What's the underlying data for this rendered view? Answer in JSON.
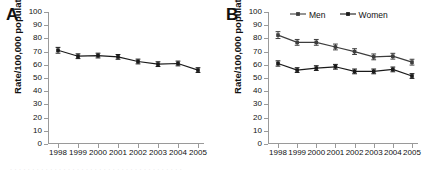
{
  "figure": {
    "cropped_caption_fragment": "· · · · · · · · · · · · · · · · · · · · · · · · · · · · · · · · · · · · · · ·"
  },
  "panels": [
    {
      "letter": "A",
      "ylabel": "Rate/100,000 population",
      "legend": []
    },
    {
      "letter": "B",
      "ylabel": "Rate/100,000 population",
      "legend": [
        "Men",
        "Women"
      ]
    }
  ],
  "chart_data": [
    {
      "type": "line",
      "title": "A",
      "xlabel": "",
      "ylabel": "Rate/100,000 population",
      "categories": [
        "1998",
        "1999",
        "2000",
        "2001",
        "2002",
        "2003",
        "2004",
        "2005"
      ],
      "x": [
        1998,
        1999,
        2000,
        2001,
        2002,
        2003,
        2004,
        2005
      ],
      "ylim": [
        0,
        100
      ],
      "yticks": [
        0,
        10,
        20,
        30,
        40,
        50,
        60,
        70,
        80,
        90,
        100
      ],
      "grid": false,
      "legend_position": "none",
      "series": [
        {
          "name": "Overall",
          "values": [
            71,
            66.5,
            67,
            66,
            62.5,
            60.5,
            61,
            56
          ],
          "error_upper": [
            2.2,
            1.8,
            1.8,
            1.8,
            1.8,
            1.8,
            1.8,
            1.8
          ],
          "error_lower": [
            2.2,
            1.8,
            1.8,
            1.8,
            1.8,
            1.8,
            1.8,
            1.8
          ],
          "color": "#1a1a1a",
          "marker": "square"
        }
      ]
    },
    {
      "type": "line",
      "title": "B",
      "xlabel": "",
      "ylabel": "Rate/100,000 population",
      "categories": [
        "1998",
        "1999",
        "2000",
        "2001",
        "2002",
        "2003",
        "2004",
        "2005"
      ],
      "x": [
        1998,
        1999,
        2000,
        2001,
        2002,
        2003,
        2004,
        2005
      ],
      "ylim": [
        0,
        100
      ],
      "yticks": [
        0,
        10,
        20,
        30,
        40,
        50,
        60,
        70,
        80,
        90,
        100
      ],
      "grid": false,
      "legend_position": "top-right",
      "series": [
        {
          "name": "Men",
          "values": [
            82.5,
            77,
            77,
            73.5,
            70,
            66,
            66.5,
            62
          ],
          "error_upper": [
            2.6,
            2.2,
            2.2,
            2.2,
            2.2,
            2.2,
            2.2,
            2.2
          ],
          "error_lower": [
            2.6,
            2.2,
            2.2,
            2.2,
            2.2,
            2.2,
            2.2,
            2.2
          ],
          "color": "#3d3d3d",
          "marker": "square"
        },
        {
          "name": "Women",
          "values": [
            61,
            56,
            57.5,
            58.5,
            55,
            55,
            56.5,
            51.5
          ],
          "error_upper": [
            2.0,
            1.8,
            1.8,
            1.8,
            1.8,
            1.8,
            1.8,
            1.8
          ],
          "error_lower": [
            2.0,
            1.8,
            1.8,
            1.8,
            1.8,
            1.8,
            1.8,
            1.8
          ],
          "color": "#1a1a1a",
          "marker": "square"
        }
      ]
    }
  ]
}
